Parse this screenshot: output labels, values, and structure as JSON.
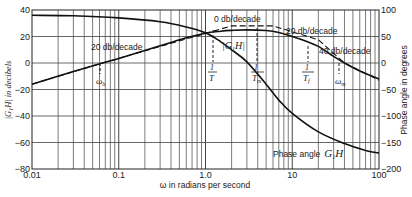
{
  "chart_data": {
    "type": "line",
    "title": "",
    "xlabel": "ω in radians per second",
    "ylabel": "|G1H| in decibels",
    "ylabel_right": "Phase angle in degrees",
    "xscale": "log",
    "xlim": [
      0.01,
      100
    ],
    "ylim": [
      -80,
      40
    ],
    "ylim_right": [
      -200,
      100
    ],
    "grid": true,
    "x_ticks": [
      {
        "value": 0.01,
        "label": "0.01"
      },
      {
        "value": 0.1,
        "label": "0.1"
      },
      {
        "value": 1,
        "label": "1.0"
      },
      {
        "value": 10,
        "label": "10"
      },
      {
        "value": 100,
        "label": "100"
      }
    ],
    "y_ticks_left": [
      {
        "value": 40,
        "label": "40"
      },
      {
        "value": 20,
        "label": "20"
      },
      {
        "value": 0,
        "label": "0"
      },
      {
        "value": -20,
        "label": "−20"
      },
      {
        "value": -40,
        "label": "−40"
      },
      {
        "value": -60,
        "label": "−60"
      },
      {
        "value": -80,
        "label": "−80"
      }
    ],
    "y_ticks_right": [
      {
        "value": 100,
        "label": "100"
      },
      {
        "value": 50,
        "label": "50"
      },
      {
        "value": 0,
        "label": "0"
      },
      {
        "value": -50,
        "label": "−50"
      },
      {
        "value": -100,
        "label": "−100"
      },
      {
        "value": -150,
        "label": "−150"
      },
      {
        "value": -200,
        "label": "−200"
      }
    ],
    "series": [
      {
        "name": "|G1H| (actual)",
        "axis": "left",
        "style": "solid",
        "x": [
          0.01,
          0.03,
          0.065,
          0.1,
          0.3,
          0.6,
          1.0,
          1.5,
          2.0,
          3.0,
          5.0,
          7.0,
          10.0,
          15.0,
          20.0,
          30.0,
          40.0,
          60.0,
          100.0
        ],
        "y": [
          -16,
          -6.5,
          0,
          3.5,
          13,
          19,
          22.5,
          24,
          24.6,
          25,
          24.5,
          23,
          20,
          16,
          12.5,
          5,
          0,
          -6,
          -12
        ]
      },
      {
        "name": "|G1H| asymptotes",
        "axis": "left",
        "style": "dashed",
        "x": [
          0.01,
          0.065,
          2.0,
          6.0,
          20.0,
          40.0,
          100.0
        ],
        "y": [
          -16,
          0,
          28,
          28,
          17.5,
          0,
          -13
        ]
      },
      {
        "name": "Phase angle G1H",
        "axis": "right",
        "style": "solid",
        "x": [
          0.01,
          0.03,
          0.1,
          0.3,
          0.6,
          1.0,
          1.5,
          2.0,
          3.0,
          5.0,
          7.0,
          10.0,
          20.0,
          40.0,
          70.0,
          100.0
        ],
        "y": [
          90,
          89,
          85,
          78,
          68,
          57,
          40,
          25,
          2,
          -40,
          -70,
          -95,
          -130,
          -152,
          -165,
          -170
        ]
      }
    ],
    "annotations": [
      {
        "text": "20 db/decade",
        "x": 0.09,
        "y": 9
      },
      {
        "text": "0 db/decade",
        "x": 3.5,
        "y": 34
      },
      {
        "text": "20 db/decade",
        "x": 12,
        "y": 30
      },
      {
        "text": "40 db/decade",
        "x": 35,
        "y": 15
      },
      {
        "text": "|G1H|",
        "x": 3.0,
        "y": 19
      },
      {
        "text": "Phase angle G1H",
        "x": 12,
        "y": -68
      },
      {
        "text": "ω_h",
        "x": 0.065,
        "y": -7
      },
      {
        "text": "1/T",
        "x": 2.0,
        "y": -1
      },
      {
        "text": "1/T_m",
        "x": 6.0,
        "y": -1
      },
      {
        "text": "1/T_f",
        "x": 20.0,
        "y": 0
      },
      {
        "text": "ω_m",
        "x": 40.0,
        "y": -7
      }
    ],
    "legend": "none"
  },
  "labels": {
    "xlabel": "ω in radians per second",
    "ylabel_left_math": "|G",
    "ylabel_left_sub": "1",
    "ylabel_left_rest": "H| in decibels",
    "ylabel_right": "Phase angle in degrees",
    "ann_20_left": "20 db/decade",
    "ann_0": "0 db/decade",
    "ann_20_right": "20 db/decade",
    "ann_40": "40 db/decade",
    "gain_label": "|G",
    "gain_label_sub": "1",
    "gain_label_rest": "H|",
    "phase_text": "Phase angle",
    "phase_math": "G",
    "phase_math_sub": "1",
    "phase_math_rest": "H",
    "omega_h": "ω",
    "omega_h_sub": "h",
    "inv_T": "T",
    "inv_Tm": "T",
    "inv_Tm_sub": "m",
    "inv_Tf": "T",
    "inv_Tf_sub": "f",
    "one": "1",
    "omega_m": "ω",
    "omega_m_sub": "m"
  }
}
